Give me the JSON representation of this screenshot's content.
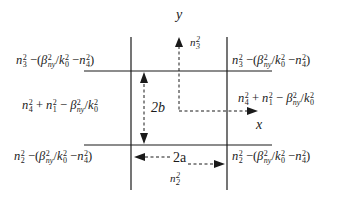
{
  "diagram": {
    "axes": {
      "x_label": "x",
      "y_label": "y"
    },
    "dimensions": {
      "width_label": "2a",
      "height_label": "2b"
    },
    "region_labels": {
      "top_axis": "n_3^2",
      "bottom_axis": "n_2^2"
    },
    "regions": {
      "top_left": "n_3^2 − (β_ny^2 / k_0^2 − n_4^2)",
      "top_right": "n_3^2 − (β_ny^2 / k_0^2 − n_4^2)",
      "middle_left": "n_4^2 + n_1^2 − β_ny^2 / k_0^2",
      "middle_right": "n_4^2 + n_1^2 − β_ny^2 / k_0^2",
      "bottom_left": "n_2^2 − (β_ny^2 / k_0^2 − n_4^2)",
      "bottom_right": "n_2^2 − (β_ny^2 / k_0^2 − n_4^2)"
    },
    "colors": {
      "line": "#1a1a1a",
      "background": "#ffffff"
    }
  }
}
